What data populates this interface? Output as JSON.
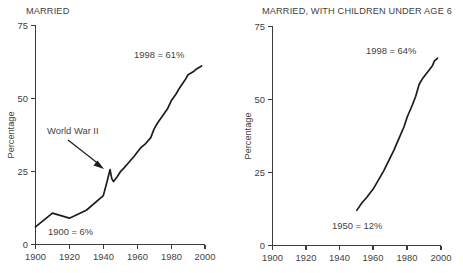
{
  "figure": {
    "background_color": "#ffffff",
    "line_color": "#1d1d1d",
    "axis_color": "#3b3b3b",
    "text_color": "#3f3f3f"
  },
  "left_panel": {
    "title": "MARRIED",
    "ylabel": "Percentage",
    "yticks": [
      "0",
      "25",
      "50",
      "75"
    ],
    "xticks": [
      "1900",
      "1920",
      "1940",
      "1960",
      "1980",
      "2000"
    ],
    "annotations": {
      "start": "1900 = 6%",
      "end": "1998 = 61%",
      "event": "World War II"
    }
  },
  "right_panel": {
    "title": "MARRIED, WITH CHILDREN UNDER AGE 6",
    "ylabel": "Percentage",
    "yticks": [
      "0",
      "25",
      "50",
      "75"
    ],
    "xticks": [
      "1900",
      "1920",
      "1940",
      "1960",
      "1980",
      "2000"
    ],
    "annotations": {
      "start": "1950 = 12%",
      "end": "1998 = 64%"
    }
  },
  "chart_data": [
    {
      "type": "line",
      "title": "MARRIED",
      "xlabel": "",
      "ylabel": "Percentage",
      "xlim": [
        1900,
        2000
      ],
      "ylim": [
        0,
        75
      ],
      "xticks": [
        1900,
        1920,
        1940,
        1960,
        1980,
        2000
      ],
      "yticks": [
        0,
        25,
        50,
        75
      ],
      "grid": false,
      "legend": "none",
      "annotations": [
        {
          "text": "1900 = 6%",
          "x": 1908,
          "y": 4
        },
        {
          "text": "1998 = 61%",
          "x": 1958,
          "y": 67
        },
        {
          "text": "World War II",
          "x": 1910,
          "y": 41
        }
      ],
      "series": [
        {
          "name": "Married women in labor force",
          "x": [
            1900,
            1910,
            1920,
            1930,
            1940,
            1942,
            1944,
            1945,
            1946,
            1948,
            1950,
            1952,
            1955,
            1958,
            1960,
            1962,
            1965,
            1968,
            1970,
            1972,
            1975,
            1978,
            1980,
            1983,
            1985,
            1988,
            1990,
            1993,
            1995,
            1998
          ],
          "y": [
            6,
            10.7,
            9,
            11.7,
            16.7,
            21,
            25.6,
            22.5,
            21.5,
            23,
            24.8,
            26,
            28,
            30,
            31.5,
            33,
            34.5,
            36.5,
            39.5,
            41.5,
            44,
            46.5,
            49,
            51.5,
            53.5,
            56,
            58,
            59,
            60,
            61
          ]
        }
      ]
    },
    {
      "type": "line",
      "title": "MARRIED, WITH CHILDREN UNDER AGE 6",
      "xlabel": "",
      "ylabel": "Percentage",
      "xlim": [
        1900,
        2000
      ],
      "ylim": [
        0,
        75
      ],
      "xticks": [
        1900,
        1920,
        1940,
        1960,
        1980,
        2000
      ],
      "yticks": [
        0,
        25,
        50,
        75
      ],
      "grid": false,
      "legend": "none",
      "annotations": [
        {
          "text": "1950 = 12%",
          "x": 1943,
          "y": 6
        },
        {
          "text": "1998 = 64%",
          "x": 1962,
          "y": 69
        }
      ],
      "series": [
        {
          "name": "Married women with children under age 6 in labor force",
          "x": [
            1950,
            1953,
            1956,
            1958,
            1960,
            1963,
            1966,
            1969,
            1972,
            1975,
            1978,
            1980,
            1983,
            1985,
            1987,
            1989,
            1991,
            1993,
            1995,
            1996,
            1998
          ],
          "y": [
            12,
            14.5,
            16.5,
            18,
            19.5,
            22.5,
            25.5,
            29,
            32.5,
            36.5,
            40.5,
            44,
            48,
            51,
            55,
            57,
            58.5,
            60,
            61.5,
            63,
            64
          ]
        }
      ]
    }
  ]
}
